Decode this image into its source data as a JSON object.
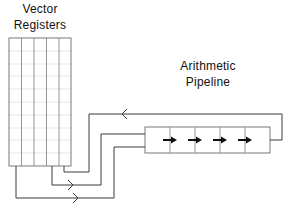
{
  "diagram": {
    "type": "block-diagram",
    "labels": {
      "vector_registers_line1": "Vector",
      "vector_registers_line2": "Registers",
      "arithmetic_pipeline_line1": "Arithmetic",
      "arithmetic_pipeline_line2": "Pipeline"
    },
    "nodes": [
      {
        "id": "vector-registers",
        "label": "Vector Registers",
        "columns": 5
      },
      {
        "id": "arithmetic-pipeline",
        "label": "Arithmetic Pipeline",
        "stages": 5,
        "stage_arrows": 4
      }
    ],
    "edges": [
      {
        "from": "vector-registers",
        "to": "arithmetic-pipeline",
        "name": "operand-1"
      },
      {
        "from": "vector-registers",
        "to": "arithmetic-pipeline",
        "name": "operand-2"
      },
      {
        "from": "arithmetic-pipeline",
        "to": "vector-registers",
        "name": "result-feedback"
      }
    ],
    "colors": {
      "line": "#3a3a3a",
      "grid": "#d8d8d8",
      "arrow": "#111111"
    }
  }
}
